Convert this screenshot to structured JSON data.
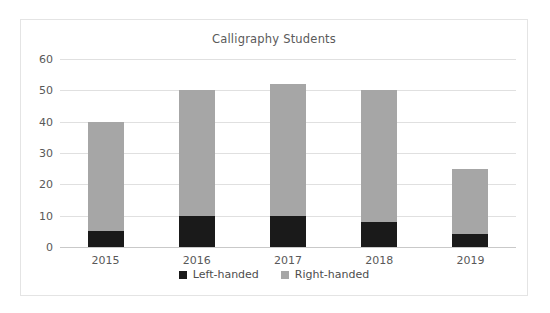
{
  "chart_data": {
    "type": "bar",
    "subtype": "stacked-column",
    "title": "Calligraphy Students",
    "xlabel": "",
    "ylabel": "",
    "categories": [
      "2015",
      "2016",
      "2017",
      "2018",
      "2019"
    ],
    "series": [
      {
        "name": "Left-handed",
        "color": "#1a1a1a",
        "values": [
          5,
          10,
          10,
          8,
          4
        ]
      },
      {
        "name": "Right-handed",
        "color": "#a6a6a6",
        "values": [
          35,
          40,
          42,
          42,
          21
        ]
      }
    ],
    "totals": [
      40,
      50,
      52,
      50,
      25
    ],
    "ylim": [
      0,
      60
    ],
    "ytick_step": 10,
    "ytick_labels": [
      "0",
      "10",
      "20",
      "30",
      "40",
      "50",
      "60"
    ],
    "grid": true,
    "legend_position": "bottom"
  },
  "legend": {
    "items": [
      {
        "label": "Left-handed",
        "color": "#1a1a1a"
      },
      {
        "label": "Right-handed",
        "color": "#a6a6a6"
      }
    ]
  },
  "colors": {
    "left_handed": "#1a1a1a",
    "right_handed": "#a6a6a6",
    "gridline": "#e0e0e0",
    "frame": "#e4e4e4",
    "text": "#595959"
  }
}
